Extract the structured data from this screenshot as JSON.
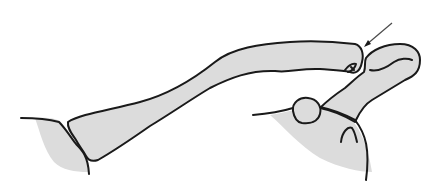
{
  "figure": {
    "colors": {
      "bone_fill": "#dcdcdc",
      "outline": "#1a1a1a",
      "arrow": "#4a4a4a",
      "background": "#ffffff"
    },
    "annotations": [
      {
        "type": "arrow",
        "points_to": "acromioclavicular-joint-gap"
      }
    ]
  }
}
